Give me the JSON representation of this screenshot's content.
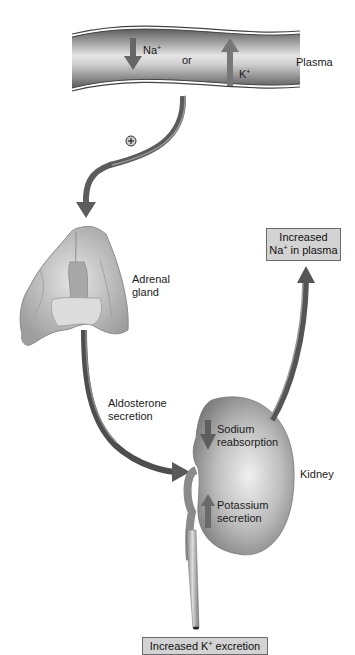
{
  "diagram": {
    "type": "physiology-flow",
    "colors": {
      "vessel_dark": "#6e6e6e",
      "vessel_light": "#e8e8e8",
      "arrow": "#5c5c5c",
      "organ": "#bdbdbd",
      "box_fill": "#d3d3d3",
      "background": "#ffffff"
    },
    "plasma": {
      "label": "Plasma",
      "na_symbol": "Na",
      "na_charge": "+",
      "or_text": "or",
      "k_symbol": "K",
      "k_charge": "+",
      "na_arrow_direction": "down",
      "k_arrow_direction": "up"
    },
    "stimulus": {
      "symbol": "+"
    },
    "adrenal": {
      "label_line1": "Adrenal",
      "label_line2": "gland"
    },
    "hormone": {
      "label_line1": "Aldosterone",
      "label_line2": "secretion"
    },
    "kidney": {
      "label": "Kidney",
      "sodium_line1": "Sodium",
      "sodium_line2": "reabsorption",
      "sodium_arrow_direction": "down",
      "potassium_line1": "Potassium",
      "potassium_line2": "secretion",
      "potassium_arrow_direction": "up"
    },
    "outcomes": {
      "plasma_box_line1": "Increased",
      "plasma_box_ion": "Na",
      "plasma_box_charge": "+",
      "plasma_box_rest": " in plasma",
      "excretion_prefix": "Increased K",
      "excretion_charge": "+",
      "excretion_suffix": " excretion"
    }
  }
}
